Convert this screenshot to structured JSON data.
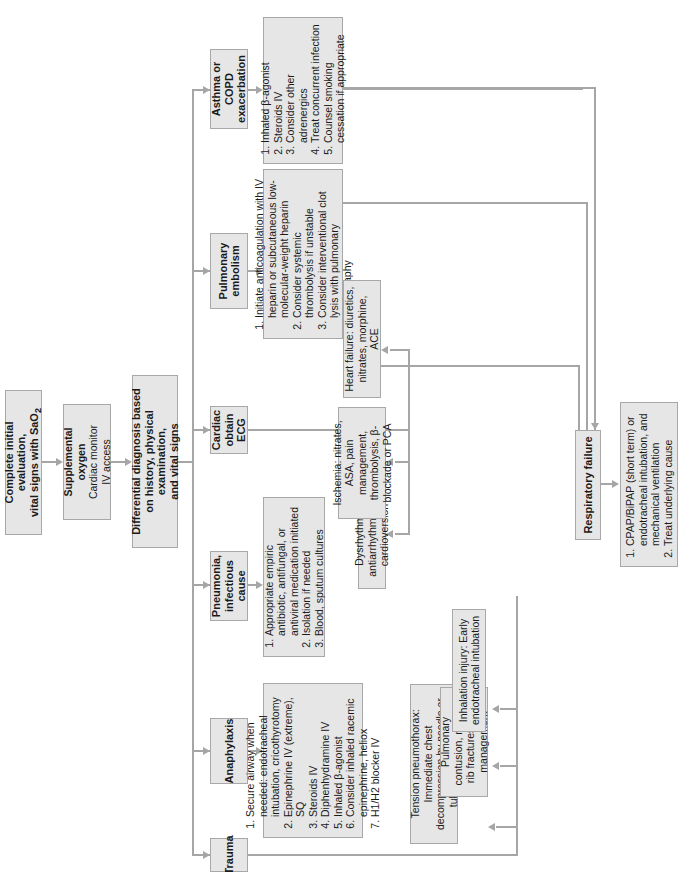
{
  "flow": {
    "initial": {
      "line1": "Complete initial evaluation,",
      "line2": "vital signs with SaO",
      "sub": "2"
    },
    "supplemental": {
      "title": "Supplemental oxygen",
      "line2": "Cardiac monitor",
      "line3": "IV access"
    },
    "differential": {
      "line1": "Differential diagnosis based",
      "line2": "on history, physical examination,",
      "line3": "and vital signs"
    }
  },
  "diagnoses": [
    {
      "id": "trauma",
      "label": "Trauma"
    },
    {
      "id": "anaphylaxis",
      "label": "Anaphylaxis"
    },
    {
      "id": "pneumonia",
      "label": "Pneumonia, infectious cause"
    },
    {
      "id": "cardiac",
      "label": "Cardiac obtain ECG"
    },
    {
      "id": "pe",
      "label": "Pulmonary embolism"
    },
    {
      "id": "asthma",
      "label": "Asthma or COPD exacerbation"
    }
  ],
  "treatments": {
    "anaphylaxis": [
      "Secure airway when needed: endotracheal intubation, cricothyrotomy",
      "Epinephrine IV (extreme), SQ",
      "Steroids IV",
      "Diphenhydramine IV",
      "Inhaled β-agonist",
      "Consider inhaled racemic epinephrine, heliox",
      "H1/H2 blocker IV"
    ],
    "pneumonia": [
      "Appropriate empiric antibiotic, antifungal, or antiviral medication initiated",
      "Isolation if needed",
      "Blood, sputum cultures"
    ],
    "pe": [
      "Initiate anticoagulation with IV heparin or subcutaneous low-molecular-weight heparin",
      "Consider systemic thrombolysis if unstable",
      "Consider interventional clot lysis with pulmonary angiography"
    ],
    "asthma": [
      "Inhaled β-agonist",
      "Steroids IV",
      "Consider other adrenergics",
      "Treat concurrent infection",
      "Counsel smoking cessation if appropriate"
    ],
    "cardiac": {
      "dysrhythmia": "Dysrhythmia: antiarrhythmics or cardioversion",
      "ischemia": "Ischemia: nitrates, ASA, pain management, thrombolysis, β-blockade or PCA",
      "heart_failure": "Heart failure: diuretics, nitrates, morphine, ACE"
    },
    "trauma": {
      "tension": "Tension pneumothorax: Immediate chest decompression by needle or tube thoracostomy",
      "contusion": "Pulmonary contusion, multiple rib fractures: Pain management",
      "inhalation": "Inhalation injury: Early endotracheal intubation"
    }
  },
  "respiratory_failure": {
    "label": "Respiratory failure",
    "treatment": [
      "CPAP/BiPAP (short term) or endotracheal intubation, and mechanical ventilation",
      "Treat underlying cause"
    ]
  },
  "colors": {
    "box_fill": "#e6e6e6",
    "box_border": "#a8a8a8",
    "connector": "#a6a6a6"
  }
}
